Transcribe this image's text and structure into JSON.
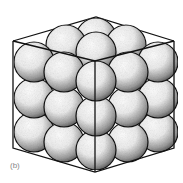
{
  "figure": {
    "panel_label": "(b)",
    "colors": {
      "line": "#111111",
      "sphere_highlight": "#ffffff",
      "sphere_shadow": "#3a3a3a",
      "background": "#ffffff",
      "label": "#888888"
    },
    "cube": {
      "top": [
        96,
        17
      ],
      "upper_left": [
        13,
        41
      ],
      "upper_right": [
        174,
        41
      ],
      "front_top": [
        95,
        61
      ],
      "lower_left": [
        13,
        148
      ],
      "lower_right": [
        174,
        148
      ],
      "front_bottom": [
        95,
        172
      ]
    },
    "sphere_radius": 20
  }
}
